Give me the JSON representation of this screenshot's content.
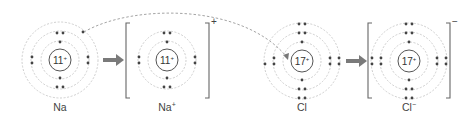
{
  "diagram": {
    "colors": {
      "shell": "#c8c8c8",
      "electron": "#444444",
      "nucleus_stroke": "#555555",
      "arrow": "#7a7a7a",
      "text": "#444444"
    },
    "species": [
      {
        "id": "na",
        "label": "Na",
        "label_sup": "",
        "nucleus": "11",
        "nucleus_sup": "+",
        "shells": [
          2,
          8,
          1
        ],
        "bracketed": false,
        "charge": ""
      },
      {
        "id": "na-ion",
        "label": "Na",
        "label_sup": "+",
        "nucleus": "11",
        "nucleus_sup": "+",
        "shells": [
          2,
          8
        ],
        "bracketed": true,
        "charge": "+"
      },
      {
        "id": "cl",
        "label": "Cl",
        "label_sup": "",
        "nucleus": "17",
        "nucleus_sup": "+",
        "shells": [
          2,
          8,
          7
        ],
        "bracketed": false,
        "charge": ""
      },
      {
        "id": "cl-ion",
        "label": "Cl",
        "label_sup": "−",
        "nucleus": "17",
        "nucleus_sup": "+",
        "shells": [
          2,
          8,
          8
        ],
        "bracketed": true,
        "charge": "−"
      }
    ],
    "arrows": [
      {
        "from": "Na",
        "to": "Na+",
        "type": "reaction"
      },
      {
        "from": "Cl",
        "to": "Cl-",
        "type": "reaction"
      },
      {
        "from": "Na outer electron",
        "to": "Cl outer shell",
        "type": "electron-transfer"
      }
    ]
  }
}
